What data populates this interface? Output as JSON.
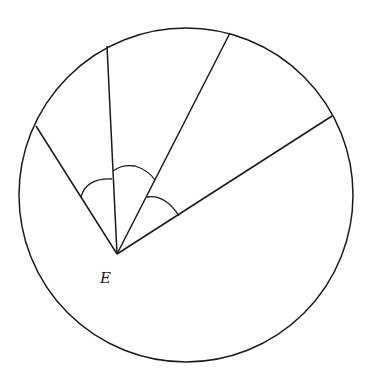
{
  "diagram": {
    "title": "",
    "stroke_color": "#1a1a1a",
    "background": "#ffffff",
    "circle": {
      "cx": 186,
      "cy": 195,
      "r": 167
    },
    "point": {
      "label": "E",
      "x": 117,
      "y": 254,
      "label_x": 101,
      "label_y": 282
    },
    "segments": [
      {
        "name": "segment-left",
        "x2": 36,
        "y2": 126
      },
      {
        "name": "segment-upper-left",
        "x2": 107,
        "y2": 46
      },
      {
        "name": "segment-upper-right",
        "x2": 230,
        "y2": 33
      },
      {
        "name": "segment-right",
        "x2": 332,
        "y2": 116
      }
    ],
    "angle_marks": [
      {
        "name": "angle-mark-1",
        "between": [
          "segment-left",
          "segment-upper-left"
        ]
      },
      {
        "name": "angle-mark-2",
        "between": [
          "segment-upper-left",
          "segment-upper-right"
        ]
      },
      {
        "name": "angle-mark-3",
        "between": [
          "segment-upper-right",
          "segment-right"
        ]
      }
    ]
  }
}
